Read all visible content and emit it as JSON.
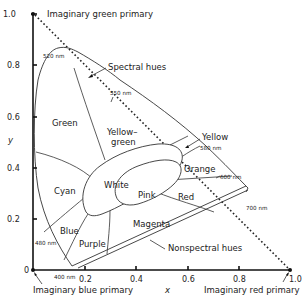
{
  "figure": {
    "axes": {
      "xlabel": "x",
      "ylabel": "y",
      "x_ticks": [
        "0.2",
        "0.4",
        "0.6",
        "0.8",
        "1.0"
      ],
      "y_ticks": [
        "0",
        "0.2",
        "0.4",
        "0.6",
        "0.8",
        "1.0"
      ],
      "xlim": [
        0,
        1.0
      ],
      "ylim": [
        0,
        1.0
      ]
    },
    "primaries": {
      "green": "Imaginary green primary",
      "blue": "Imaginary blue primary",
      "red": "Imaginary red primary"
    },
    "annotations": {
      "spectral": "Spectral hues",
      "nonspectral": "Nonspectral hues"
    },
    "wavelengths": {
      "w520": "520 nm",
      "w550": "550 nm",
      "w580": "580 nm",
      "w600": "600 nm",
      "w700": "700 nm",
      "w480": "480 nm",
      "w400": "400 nm"
    },
    "regions": {
      "green": "Green",
      "yellow_green_1": "Yellow–",
      "yellow_green_2": "green",
      "yellow": "Yellow",
      "orange": "Orange",
      "cyan": "Cyan",
      "white": "White",
      "pink": "Pink",
      "red": "Red",
      "blue": "Blue",
      "purple": "Purple",
      "magenta": "Magenta"
    },
    "colors": {
      "line": "#333333",
      "axis": "#111111",
      "background": "#ffffff"
    }
  }
}
